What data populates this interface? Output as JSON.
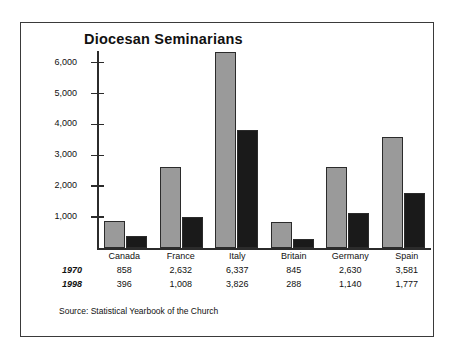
{
  "figure": {
    "title": "Diocesan Seminarians",
    "source_note": "Source: Statistical Yearbook of the Church"
  },
  "colors": {
    "series_1970": "#9a9a9a",
    "series_1998": "#1a1a1a",
    "axis": "#2b2b2b",
    "frame": "#3a3a3a",
    "text": "#111111",
    "background": "#ffffff"
  },
  "table": {
    "corner_label": "",
    "row_labels": [
      "1970",
      "1998"
    ],
    "columns": [
      "Canada",
      "France",
      "Italy",
      "Britain",
      "Germany",
      "Spain"
    ],
    "rows": [
      [
        "858",
        "2,632",
        "6,337",
        "845",
        "2,630",
        "3,581"
      ],
      [
        "396",
        "1,008",
        "3,826",
        "288",
        "1,140",
        "1,777"
      ]
    ]
  },
  "chart_data": {
    "type": "bar",
    "title": "Diocesan Seminarians",
    "xlabel": "",
    "ylabel": "",
    "categories": [
      "Canada",
      "France",
      "Italy",
      "Britain",
      "Germany",
      "Spain"
    ],
    "series": [
      {
        "name": "1970",
        "values": [
          858,
          2632,
          6337,
          845,
          2630,
          3581
        ],
        "color": "#9a9a9a"
      },
      {
        "name": "1998",
        "values": [
          396,
          1008,
          3826,
          288,
          1140,
          1777
        ],
        "color": "#1a1a1a"
      }
    ],
    "ylim": [
      0,
      6500
    ],
    "yticks": [
      1000,
      2000,
      3000,
      4000,
      5000,
      6000
    ],
    "ytick_labels": [
      "1,000",
      "2,000",
      "3,000",
      "4,000",
      "5,000",
      "6,000"
    ],
    "grid": false,
    "legend": "none",
    "annotations": [
      "Source: Statistical Yearbook of the Church"
    ]
  }
}
